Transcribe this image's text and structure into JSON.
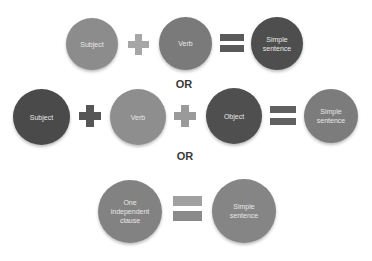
{
  "separators": [
    "OR",
    "OR"
  ],
  "rows": [
    {
      "terms": [
        {
          "label": "Subject",
          "color": "#8c8c8c"
        },
        {
          "label": "Verb",
          "color": "#7a7a7a"
        }
      ],
      "operators": [
        "+",
        "="
      ],
      "result": {
        "label": "Simple sentence",
        "color": "#4e4e4e"
      }
    },
    {
      "terms": [
        {
          "label": "Subject",
          "color": "#4a4a4a"
        },
        {
          "label": "Verb",
          "color": "#8e8e8e"
        },
        {
          "label": "Object",
          "color": "#4f4f4f"
        }
      ],
      "operators": [
        "+",
        "+",
        "="
      ],
      "result": {
        "label": "Simple sentence",
        "color": "#7c7c7c"
      }
    },
    {
      "terms": [
        {
          "label": "One independent clause",
          "color": "#828282"
        }
      ],
      "operators": [
        "="
      ],
      "result": {
        "label": "Simple sentence",
        "color": "#858585"
      }
    }
  ]
}
